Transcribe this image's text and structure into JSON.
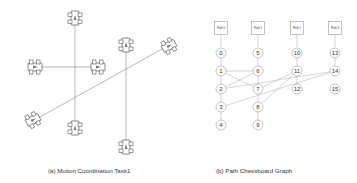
{
  "panel_a": {
    "caption": "(a) Motion Coordination Task1",
    "cars": [
      {
        "id": "car-top",
        "x": 75,
        "y": 18,
        "rot": 0
      },
      {
        "id": "car-left",
        "x": 35,
        "y": 67,
        "rot": 90
      },
      {
        "id": "car-right",
        "x": 98,
        "y": 67,
        "rot": 90
      },
      {
        "id": "car-upper-right",
        "x": 126,
        "y": 45,
        "rot": 0
      },
      {
        "id": "car-far-right",
        "x": 169,
        "y": 46,
        "rot": 62
      },
      {
        "id": "car-lower-left",
        "x": 33,
        "y": 120,
        "rot": 62
      },
      {
        "id": "car-bottom",
        "x": 75,
        "y": 128,
        "rot": 0
      },
      {
        "id": "car-bottom-right",
        "x": 126,
        "y": 147,
        "rot": 0
      }
    ],
    "paths": [
      {
        "x1": 75,
        "y1": 25,
        "x2": 75,
        "y2": 121
      },
      {
        "x1": 42,
        "y1": 67,
        "x2": 91,
        "y2": 67
      },
      {
        "x1": 126,
        "y1": 52,
        "x2": 126,
        "y2": 140
      },
      {
        "x1": 40,
        "y1": 117,
        "x2": 162,
        "y2": 49
      }
    ]
  },
  "panel_b": {
    "caption": "(b) Path Chessboard Graph",
    "paths": [
      {
        "label": "Path 0",
        "x": 221,
        "y": 28
      },
      {
        "label": "Path 1",
        "x": 258,
        "y": 28
      },
      {
        "label": "Path 2",
        "x": 297,
        "y": 28
      },
      {
        "label": "Path 3",
        "x": 335,
        "y": 28
      }
    ],
    "nodes": [
      {
        "id": "0",
        "x": 221,
        "y": 53
      },
      {
        "id": "1",
        "x": 221,
        "y": 71
      },
      {
        "id": "2",
        "x": 221,
        "y": 89
      },
      {
        "id": "3",
        "x": 221,
        "y": 107
      },
      {
        "id": "4",
        "x": 221,
        "y": 125
      },
      {
        "id": "5",
        "x": 258,
        "y": 53
      },
      {
        "id": "6",
        "x": 258,
        "y": 71
      },
      {
        "id": "7",
        "x": 258,
        "y": 89
      },
      {
        "id": "8",
        "x": 258,
        "y": 107
      },
      {
        "id": "9",
        "x": 258,
        "y": 125
      },
      {
        "id": "10",
        "x": 297,
        "y": 53
      },
      {
        "id": "11",
        "x": 297,
        "y": 71
      },
      {
        "id": "12",
        "x": 297,
        "y": 89
      },
      {
        "id": "13",
        "x": 335,
        "y": 53
      },
      {
        "id": "14",
        "x": 335,
        "y": 71
      },
      {
        "id": "15",
        "x": 335,
        "y": 89
      }
    ],
    "chain_edges": [
      [
        "0",
        "1"
      ],
      [
        "1",
        "2"
      ],
      [
        "2",
        "3"
      ],
      [
        "3",
        "4"
      ],
      [
        "5",
        "6"
      ],
      [
        "6",
        "7"
      ],
      [
        "7",
        "8"
      ],
      [
        "8",
        "9"
      ],
      [
        "10",
        "11"
      ],
      [
        "11",
        "12"
      ],
      [
        "13",
        "14"
      ]
    ],
    "cross_edges": [
      [
        "1",
        "6"
      ],
      [
        "2",
        "6"
      ],
      [
        "1",
        "7"
      ],
      [
        "2",
        "14"
      ],
      [
        "3",
        "14"
      ],
      [
        "8",
        "11"
      ],
      [
        "7",
        "11"
      ]
    ]
  }
}
